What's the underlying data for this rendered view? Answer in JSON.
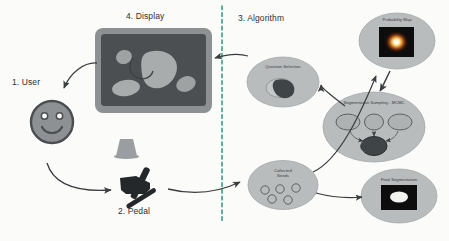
{
  "figure": {
    "type": "pipeline-diagram",
    "background_color": "#fbfbfa",
    "divider": {
      "name": "vertical-dashed-divider",
      "color": "#49a08a",
      "style": "dashed",
      "x": 222
    }
  },
  "stages": {
    "user": {
      "label": "1. User",
      "icon": "smiley-face-icon"
    },
    "pedal": {
      "label": "2. Pedal",
      "icon": "foot-pedal-icon"
    },
    "algorithm": {
      "label": "3. Algorithm"
    },
    "display": {
      "label": "4. Display",
      "icon": "monitor-icon"
    }
  },
  "algorithm_nodes": [
    {
      "id": "collected-seeds",
      "label": "Collected\nSeeds",
      "label_line1": "Collected",
      "label_line2": "Seeds",
      "seed_count": 5
    },
    {
      "id": "probability-map",
      "label": "Probability Map"
    },
    {
      "id": "segmentation-sampling",
      "label": "Segmentation Sampling - MCMC",
      "sample_count": 3
    },
    {
      "id": "question-selection",
      "label": "Question Selection"
    },
    {
      "id": "final-segmentation",
      "label": "Final Segmentation"
    }
  ],
  "colors": {
    "ellipse_fill": "#b9bcbd",
    "ellipse_stroke": "#a3a7a8",
    "monitor_bezel": "#8d9193",
    "monitor_screen": "#4b4f51",
    "blob_light": "#a8acad",
    "blob_dark": "#3f4446",
    "smiley_fill": "#8d9193",
    "smiley_stroke": "#4a4e50",
    "pedal": "#25282a",
    "arrow": "#3a3d3f",
    "divider": "#49a08a",
    "text": "#2f2f2f",
    "map_black": "#0d0d0d",
    "map_hot": "#ffffff"
  }
}
